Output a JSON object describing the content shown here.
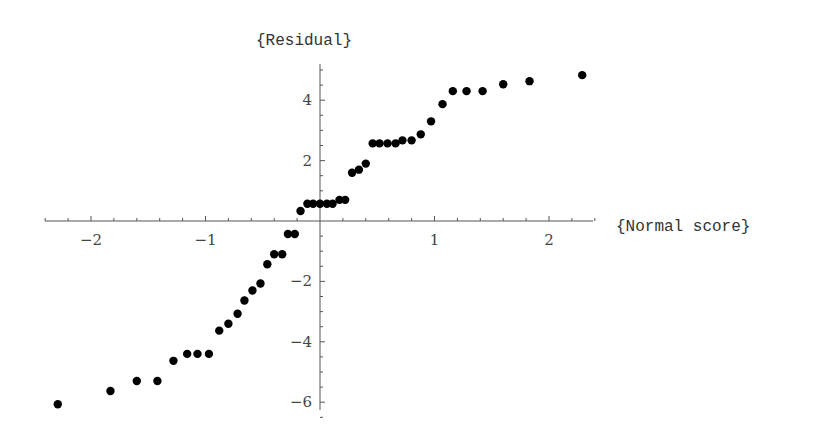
{
  "chart_data": {
    "type": "scatter",
    "title": "",
    "xlabel": "{Normal score}",
    "ylabel": "{Residual}",
    "xlim": [
      -2.4,
      2.4
    ],
    "ylim": [
      -6.4,
      5.1
    ],
    "grid": false,
    "legend": null,
    "x_ticks": [
      -2,
      -1,
      1,
      2
    ],
    "x_tick_labels": [
      "-2",
      "-1",
      "1",
      "2"
    ],
    "y_ticks": [
      -6,
      -4,
      -2,
      2,
      4
    ],
    "y_tick_labels": [
      "-6",
      "-4",
      "-2",
      "2",
      "4"
    ],
    "series": [
      {
        "name": "residuals",
        "points": [
          [
            -2.29,
            -6.07
          ],
          [
            -1.83,
            -5.63
          ],
          [
            -1.6,
            -5.3
          ],
          [
            -1.42,
            -5.3
          ],
          [
            -1.28,
            -4.63
          ],
          [
            -1.16,
            -4.4
          ],
          [
            -1.07,
            -4.4
          ],
          [
            -0.97,
            -4.4
          ],
          [
            -0.88,
            -3.63
          ],
          [
            -0.8,
            -3.4
          ],
          [
            -0.72,
            -3.07
          ],
          [
            -0.66,
            -2.63
          ],
          [
            -0.59,
            -2.3
          ],
          [
            -0.52,
            -2.07
          ],
          [
            -0.46,
            -1.43
          ],
          [
            -0.4,
            -1.1
          ],
          [
            -0.33,
            -1.1
          ],
          [
            -0.28,
            -0.43
          ],
          [
            -0.22,
            -0.43
          ],
          [
            -0.17,
            0.33
          ],
          [
            -0.11,
            0.57
          ],
          [
            -0.06,
            0.57
          ],
          [
            0.0,
            0.57
          ],
          [
            0.06,
            0.57
          ],
          [
            0.11,
            0.57
          ],
          [
            0.17,
            0.7
          ],
          [
            0.22,
            0.7
          ],
          [
            0.28,
            1.6
          ],
          [
            0.34,
            1.7
          ],
          [
            0.4,
            1.9
          ],
          [
            0.46,
            2.57
          ],
          [
            0.52,
            2.57
          ],
          [
            0.59,
            2.57
          ],
          [
            0.66,
            2.57
          ],
          [
            0.72,
            2.67
          ],
          [
            0.8,
            2.67
          ],
          [
            0.88,
            2.87
          ],
          [
            0.97,
            3.3
          ],
          [
            1.07,
            3.87
          ],
          [
            1.16,
            4.3
          ],
          [
            1.28,
            4.3
          ],
          [
            1.42,
            4.3
          ],
          [
            1.6,
            4.53
          ],
          [
            1.83,
            4.63
          ],
          [
            2.29,
            4.83
          ]
        ]
      }
    ]
  },
  "plot": {
    "x_axis_label": "{Normal score}",
    "y_axis_label": "{Residual}"
  }
}
